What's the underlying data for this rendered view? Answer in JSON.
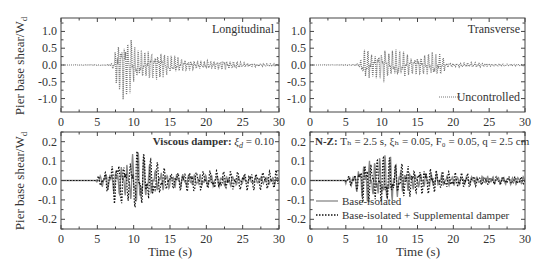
{
  "figure": {
    "ylabel": "Pier base shear/W",
    "ylabel_sub": "d",
    "xlabel": "Time (s)"
  },
  "chart_data": [
    {
      "id": "top-left",
      "type": "line",
      "title": "Longitudinal",
      "xlabel": "",
      "ylabel": "Pier base shear/W_d",
      "xlim": [
        0,
        30
      ],
      "ylim": [
        -1.4,
        1.4
      ],
      "xticks": [
        0,
        5,
        10,
        15,
        20,
        25,
        30
      ],
      "xtick_labels": [
        "0",
        "5",
        "10",
        "15",
        "20",
        "25",
        "30"
      ],
      "yticks": [
        1.0,
        0.5,
        0.0,
        -0.5,
        -1.0
      ],
      "ytick_labels": [
        "1.0",
        "0.5",
        "0.0",
        "-0.5",
        "-1.0"
      ],
      "annotation": "Longitudinal",
      "series": [
        {
          "name": "Uncontrolled",
          "style": "dotted",
          "color": "#777777",
          "envelope": [
            [
              0,
              0.0
            ],
            [
              6,
              0.01
            ],
            [
              7,
              0.04
            ],
            [
              7.6,
              0.6
            ],
            [
              8.4,
              0.9
            ],
            [
              8.8,
              1.0
            ],
            [
              9.4,
              1.0
            ],
            [
              10,
              0.6
            ],
            [
              11,
              0.45
            ],
            [
              12,
              0.45
            ],
            [
              13,
              0.4
            ],
            [
              14,
              0.4
            ],
            [
              15,
              0.3
            ],
            [
              17,
              0.18
            ],
            [
              19,
              0.12
            ],
            [
              21,
              0.12
            ],
            [
              22,
              0.15
            ],
            [
              24,
              0.1
            ],
            [
              26,
              0.05
            ],
            [
              30,
              0.03
            ]
          ],
          "freq_hz": 2.2
        }
      ]
    },
    {
      "id": "top-right",
      "type": "line",
      "title": "Transverse",
      "xlim": [
        0,
        30
      ],
      "ylim": [
        -1.4,
        1.4
      ],
      "xticks": [
        0,
        5,
        10,
        15,
        20,
        25,
        30
      ],
      "xtick_labels": [
        "0",
        "5",
        "10",
        "15",
        "20",
        "25",
        "30"
      ],
      "yticks": [
        1.0,
        0.5,
        0.0,
        -0.5,
        -1.0
      ],
      "ytick_labels": [
        "1.0",
        "0.5",
        "0.0",
        "-0.5",
        "-1.0"
      ],
      "annotation": "Transverse",
      "legend": [
        {
          "label": "Uncontrolled",
          "style": "dotted"
        }
      ],
      "legend_position": "lower right",
      "series": [
        {
          "name": "Uncontrolled",
          "style": "dotted",
          "color": "#777777",
          "envelope": [
            [
              0,
              0.0
            ],
            [
              6,
              0.01
            ],
            [
              7,
              0.08
            ],
            [
              7.5,
              0.45
            ],
            [
              8,
              0.5
            ],
            [
              9,
              0.35
            ],
            [
              10,
              0.45
            ],
            [
              10.5,
              0.55
            ],
            [
              11,
              0.35
            ],
            [
              12,
              0.5
            ],
            [
              13,
              0.4
            ],
            [
              14,
              0.3
            ],
            [
              15,
              0.25
            ],
            [
              16,
              0.35
            ],
            [
              17,
              0.4
            ],
            [
              18,
              0.35
            ],
            [
              18.5,
              0.3
            ],
            [
              19,
              0.06
            ],
            [
              21,
              0.06
            ],
            [
              23,
              0.08
            ],
            [
              25,
              0.04
            ],
            [
              30,
              0.02
            ]
          ],
          "freq_hz": 2.0
        }
      ]
    },
    {
      "id": "bottom-left",
      "type": "line",
      "xlabel": "Time (s)",
      "xlim": [
        0,
        30
      ],
      "ylim": [
        -0.25,
        0.25
      ],
      "xticks": [
        0,
        5,
        10,
        15,
        20,
        25,
        30
      ],
      "xtick_labels": [
        "0",
        "5",
        "10",
        "15",
        "20",
        "25",
        "30"
      ],
      "yticks": [
        0.2,
        0.1,
        0.0,
        -0.1,
        -0.2
      ],
      "ytick_labels": [
        "0.2",
        "0.1",
        "0.0",
        "-0.1",
        "-0.2"
      ],
      "annotation": "Viscous damper: ξ_d = 0.10",
      "annotation_bold": "Viscous damper:",
      "annotation_rest": " ξ",
      "annotation_sub": "d",
      "annotation_tail": " = 0.10",
      "series": [
        {
          "name": "Base-isolated",
          "style": "solid",
          "color": "#888888",
          "envelope": [
            [
              0,
              0
            ],
            [
              4.8,
              0
            ],
            [
              5,
              0.02
            ],
            [
              6,
              0.04
            ],
            [
              7,
              0.05
            ],
            [
              8,
              0.08
            ],
            [
              9,
              0.08
            ],
            [
              10,
              0.16
            ],
            [
              11,
              0.14
            ],
            [
              12,
              0.09
            ],
            [
              13,
              0.06
            ],
            [
              15,
              0.04
            ],
            [
              18,
              0.03
            ],
            [
              22,
              0.03
            ],
            [
              26,
              0.02
            ],
            [
              30,
              0.02
            ]
          ],
          "freq_hz": 1.3
        },
        {
          "name": "Base-isolated + Supplemental damper",
          "style": "dotted",
          "color": "#111111",
          "envelope": [
            [
              0,
              0
            ],
            [
              4.8,
              0
            ],
            [
              5,
              0.02
            ],
            [
              6,
              0.04
            ],
            [
              7,
              0.1
            ],
            [
              7.5,
              0.13
            ],
            [
              8.5,
              0.12
            ],
            [
              9.5,
              0.1
            ],
            [
              10.5,
              0.2
            ],
            [
              11.5,
              0.14
            ],
            [
              12.5,
              0.12
            ],
            [
              13,
              0.1
            ],
            [
              15,
              0.04
            ],
            [
              18,
              0.06
            ],
            [
              20,
              0.05
            ],
            [
              22,
              0.05
            ],
            [
              25,
              0.05
            ],
            [
              28,
              0.05
            ],
            [
              30,
              0.05
            ]
          ],
          "freq_hz": 1.1
        }
      ]
    },
    {
      "id": "bottom-right",
      "type": "line",
      "xlabel": "Time (s)",
      "xlim": [
        0,
        30
      ],
      "ylim": [
        -0.25,
        0.25
      ],
      "xticks": [
        0,
        5,
        10,
        15,
        20,
        25,
        30
      ],
      "xtick_labels": [
        "0",
        "5",
        "10",
        "15",
        "20",
        "25",
        "30"
      ],
      "yticks": [
        0.2,
        0.1,
        0.0,
        -0.1,
        -0.2
      ],
      "ytick_labels": [
        "0.2",
        "0.1",
        "0.0",
        "-0.1",
        "-0.2"
      ],
      "annotation": "N-Z: T_b = 2.5 s, ξ_b = 0.05, F_0 = 0.05, q = 2.5 cm",
      "annotation_bold": "N-Z:",
      "annotation_rest": " Tₕ = 2.5 s, ξₕ = 0.05, F₀ = 0.05, q = 2.5 cm",
      "legend": [
        {
          "label": "Base-isolated",
          "style": "solid"
        },
        {
          "label": "Base-isolated + Supplemental damper",
          "style": "dotted"
        }
      ],
      "legend_position": "lower left",
      "series": [
        {
          "name": "Base-isolated",
          "style": "solid",
          "color": "#888888",
          "envelope": [
            [
              0,
              0
            ],
            [
              4.8,
              0
            ],
            [
              5,
              0.02
            ],
            [
              6,
              0.03
            ],
            [
              7,
              0.08
            ],
            [
              8,
              0.11
            ],
            [
              9,
              0.1
            ],
            [
              10,
              0.12
            ],
            [
              11,
              0.14
            ],
            [
              12,
              0.1
            ],
            [
              13,
              0.06
            ],
            [
              15,
              0.04
            ],
            [
              18,
              0.03
            ],
            [
              22,
              0.02
            ],
            [
              26,
              0.02
            ],
            [
              30,
              0.02
            ]
          ],
          "freq_hz": 1.4
        },
        {
          "name": "Base-isolated + Supplemental damper",
          "style": "dotted",
          "color": "#111111",
          "envelope": [
            [
              0,
              0
            ],
            [
              4.8,
              0
            ],
            [
              5,
              0.02
            ],
            [
              6,
              0.03
            ],
            [
              7,
              0.08
            ],
            [
              7.5,
              0.12
            ],
            [
              9,
              0.1
            ],
            [
              10,
              0.14
            ],
            [
              11,
              0.12
            ],
            [
              12,
              0.08
            ],
            [
              13,
              0.09
            ],
            [
              14,
              0.08
            ],
            [
              15,
              0.06
            ],
            [
              16,
              0.08
            ],
            [
              17,
              0.07
            ],
            [
              18,
              0.05
            ],
            [
              20,
              0.04
            ],
            [
              22,
              0.04
            ],
            [
              24,
              0.02
            ],
            [
              26,
              0.02
            ],
            [
              30,
              0.02
            ]
          ],
          "freq_hz": 1.2
        }
      ]
    }
  ]
}
